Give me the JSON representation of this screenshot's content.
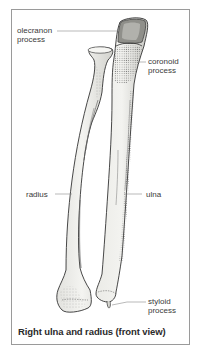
{
  "figure": {
    "caption": "Right ulna and radius (front view)",
    "labels": {
      "olecranon": [
        "olecranon",
        "process"
      ],
      "coronoid": [
        "coronoid",
        "process"
      ],
      "radius": "radius",
      "ulna": "ulna",
      "styloid": [
        "styloid",
        "process"
      ]
    },
    "colors": {
      "frame_border": "#9a9a9a",
      "bone_fill": "#f1f1ee",
      "bone_outline": "#333333",
      "shading": "#8a8a8a",
      "label_text": "#3a3a3a",
      "leader_line": "#8c8c8c"
    }
  }
}
